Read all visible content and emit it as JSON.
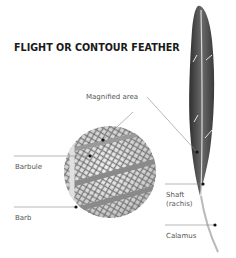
{
  "title": "FLIGHT OR CONTOUR FEATHER",
  "labels": {
    "magnified_area": "Magnified area",
    "barbule": "Barbule",
    "barb": "Barb",
    "shaft": "Shaft",
    "rachis": "(rachis)",
    "calamus": "Calamus"
  },
  "colors": {
    "title": "#1a1a1a",
    "label": "#555555",
    "leader_line": "#888888",
    "feather": "#4a4a4a"
  }
}
